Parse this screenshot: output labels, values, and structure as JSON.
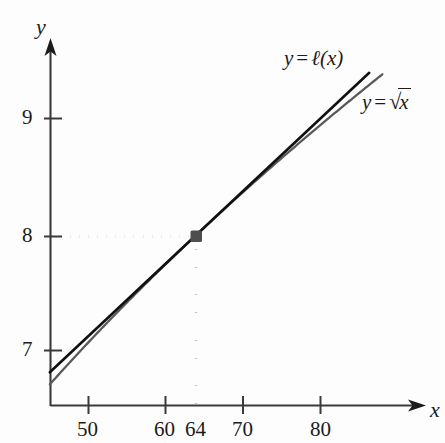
{
  "chart_data": {
    "type": "line",
    "title": "",
    "xlabel": "x",
    "ylabel": "y",
    "xlim": [
      45,
      88
    ],
    "ylim": [
      6.6,
      9.6
    ],
    "grid": false,
    "legend_position": "inline-right",
    "x_ticks": [
      50,
      60,
      70,
      80
    ],
    "x_tick_labels": [
      "50",
      "60",
      "70",
      "80"
    ],
    "y_ticks": [
      7,
      8,
      9
    ],
    "y_tick_labels": [
      "7",
      "8",
      "9"
    ],
    "extra_x_labels": [
      {
        "value": 64,
        "label": "64",
        "tick": false
      }
    ],
    "series": [
      {
        "name": "y = ℓ(x)",
        "kind": "tangent-line",
        "formula": "l(x) = 8 + (x - 64)/16",
        "color": "#111111",
        "x": [
          45,
          88
        ],
        "y": [
          6.8125,
          9.5
        ]
      },
      {
        "name": "y = √x",
        "kind": "sqrt-curve",
        "formula": "sqrt(x)",
        "color": "#5a5a5a",
        "x": [
          45,
          50,
          55,
          60,
          64,
          70,
          75,
          80,
          85,
          88
        ],
        "y": [
          6.708,
          7.071,
          7.416,
          7.746,
          8.0,
          8.367,
          8.66,
          8.944,
          9.22,
          9.381
        ]
      }
    ],
    "annotations": [
      {
        "name": "tangent-point",
        "x": 64,
        "y": 8,
        "label": "",
        "marker": "square",
        "color": "#4d4d4d"
      },
      {
        "name": "dotted-horizontal-guide",
        "from": [
          45,
          8
        ],
        "to": [
          64,
          8
        ],
        "style": "dotted"
      },
      {
        "name": "dotted-vertical-guide",
        "from": [
          64,
          6.6
        ],
        "to": [
          64,
          8
        ],
        "style": "dotted"
      }
    ]
  },
  "axes": {
    "y_axis_name": "y",
    "x_axis_name": "x"
  },
  "labels": {
    "tangent": {
      "lhs": "y",
      "op": "=",
      "rhs_prefix": "ℓ",
      "rhs_arg": "(x)"
    },
    "sqrt": {
      "lhs": "y",
      "op": "=",
      "radical_sign": "√",
      "radical_arg": "x"
    }
  },
  "ticks": {
    "x": [
      "50",
      "60",
      "64",
      "70",
      "80"
    ],
    "y": [
      "9",
      "8",
      "7"
    ]
  }
}
